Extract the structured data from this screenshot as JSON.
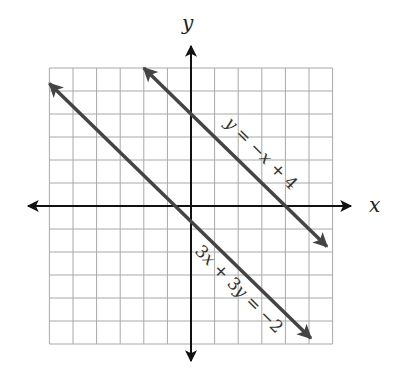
{
  "chart_data": {
    "type": "line",
    "title": "",
    "xlabel": "x",
    "ylabel": "y",
    "xlim": [
      -6,
      6
    ],
    "ylim": [
      -6,
      6
    ],
    "grid": true,
    "grid_step": 1,
    "tick_labels": false,
    "series": [
      {
        "name": "y = -x + 4",
        "label": "y = −x + 4",
        "slope": -1,
        "intercept": 4,
        "x": [
          -2,
          5.76
        ],
        "y": [
          6,
          -1.76
        ]
      },
      {
        "name": "3x + 3y = -2",
        "label": "3x + 3y = −2",
        "slope": -1,
        "intercept": -0.667,
        "x": [
          -6,
          5.08
        ],
        "y": [
          5.33,
          -5.75
        ]
      }
    ],
    "annotations": [
      "y = −x + 4",
      "3x + 3y = −2"
    ]
  },
  "colors": {
    "grid": "#a8a8a8",
    "axis": "#111111",
    "line": "#444444"
  },
  "labels": {
    "x_axis": "x",
    "y_axis": "y",
    "eq1_parts": [
      "y",
      " = −",
      "x",
      " + 4"
    ],
    "eq2_parts": [
      "3",
      "x",
      " + 3",
      "y",
      " = −2"
    ]
  }
}
